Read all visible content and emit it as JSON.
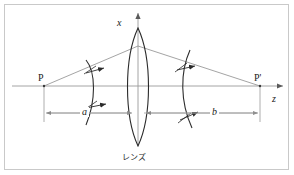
{
  "figure": {
    "kind": "optical-imaging-diagram",
    "caption_label": "レンズ",
    "background_color": "#ffffff",
    "border_color": "#c9c9c9",
    "line_color": "#3a3a3a",
    "axis_color": "#8a8a8a",
    "ray_color": "#7a7a7a",
    "dimension_color": "#9a9a9a",
    "labels": {
      "x_axis": "x",
      "z_axis": "z",
      "object_point": "P",
      "image_point": "P'",
      "object_distance": "a",
      "image_distance": "b",
      "lens": "レンズ"
    },
    "elements": [
      {
        "name": "object-point-P",
        "type": "point",
        "label": "P"
      },
      {
        "name": "image-point-P-prime",
        "type": "point",
        "label": "P'"
      },
      {
        "name": "lens",
        "type": "biconvex-lens",
        "label": "レンズ"
      },
      {
        "name": "diverging-wavefront",
        "type": "arc",
        "direction": "right"
      },
      {
        "name": "converging-wavefront",
        "type": "arc",
        "direction": "right"
      },
      {
        "name": "optical-axis",
        "type": "axis",
        "label": "z"
      },
      {
        "name": "vertical-axis",
        "type": "axis",
        "label": "x"
      },
      {
        "name": "distance-a",
        "type": "dimension",
        "label": "a"
      },
      {
        "name": "distance-b",
        "type": "dimension",
        "label": "b"
      }
    ]
  }
}
